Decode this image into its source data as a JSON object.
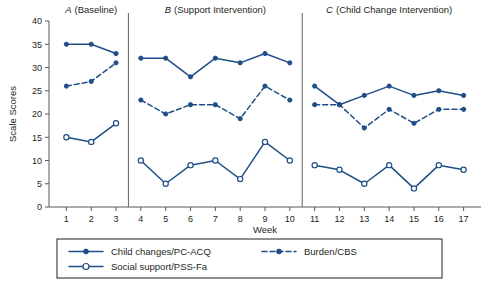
{
  "chart_data": {
    "type": "line",
    "title": "",
    "xlabel": "Week",
    "ylabel": "Scale Scores",
    "xlim": [
      0.3,
      17.7
    ],
    "ylim": [
      0,
      40
    ],
    "yticks": [
      0,
      5,
      10,
      15,
      20,
      25,
      30,
      35,
      40
    ],
    "xticks": [
      1,
      2,
      3,
      4,
      5,
      6,
      7,
      8,
      9,
      10,
      11,
      12,
      13,
      14,
      15,
      16,
      17
    ],
    "grid": false,
    "legend_position": "bottom",
    "accent_color": "#1f4e87",
    "axis_color": "#58595b",
    "panels": [
      {
        "id": "A",
        "letter": "A",
        "label": "(Baseline)",
        "title": "A (Baseline)",
        "weeks": [
          1,
          2,
          3
        ]
      },
      {
        "id": "B",
        "letter": "B",
        "label": "(Support Intervention)",
        "title": "B (Support Intervention)",
        "weeks": [
          4,
          5,
          6,
          7,
          8,
          9,
          10
        ]
      },
      {
        "id": "C",
        "letter": "C",
        "label": "(Child Change Intervention)",
        "title": "C (Child Change Intervention)",
        "weeks": [
          11,
          12,
          13,
          14,
          15,
          16,
          17
        ]
      }
    ],
    "dividers": [
      3.5,
      10.5
    ],
    "series": [
      {
        "name": "Child changes/PC-ACQ",
        "style": "solid",
        "marker": "filled-circle",
        "color": "#1f4e87",
        "segments": [
          {
            "panel": "A",
            "x": [
              1,
              2,
              3
            ],
            "values": [
              35,
              35,
              33
            ]
          },
          {
            "panel": "B",
            "x": [
              4,
              5,
              6,
              7,
              8,
              9,
              10
            ],
            "values": [
              32,
              32,
              28,
              32,
              31,
              33,
              31
            ]
          },
          {
            "panel": "C",
            "x": [
              11,
              12,
              13,
              14,
              15,
              16,
              17
            ],
            "values": [
              26,
              22,
              24,
              26,
              24,
              25,
              24
            ]
          }
        ]
      },
      {
        "name": "Burden/CBS",
        "style": "dashed",
        "marker": "filled-circle",
        "color": "#1f4e87",
        "segments": [
          {
            "panel": "A",
            "x": [
              1,
              2,
              3
            ],
            "values": [
              26,
              27,
              31
            ]
          },
          {
            "panel": "B",
            "x": [
              4,
              5,
              6,
              7,
              8,
              9,
              10
            ],
            "values": [
              23,
              20,
              22,
              22,
              19,
              26,
              23
            ]
          },
          {
            "panel": "C",
            "x": [
              11,
              12,
              13,
              14,
              15,
              16,
              17
            ],
            "values": [
              22,
              22,
              17,
              21,
              18,
              21,
              21
            ]
          }
        ]
      },
      {
        "name": "Social support/PSS-Fa",
        "style": "solid",
        "marker": "open-circle",
        "color": "#1f4e87",
        "segments": [
          {
            "panel": "A",
            "x": [
              1,
              2,
              3
            ],
            "values": [
              15,
              14,
              18
            ]
          },
          {
            "panel": "B",
            "x": [
              4,
              5,
              6,
              7,
              8,
              9,
              10
            ],
            "values": [
              10,
              5,
              9,
              10,
              6,
              14,
              10
            ]
          },
          {
            "panel": "C",
            "x": [
              11,
              12,
              13,
              14,
              15,
              16,
              17
            ],
            "values": [
              9,
              8,
              5,
              9,
              4,
              9,
              8
            ]
          }
        ]
      }
    ],
    "legend": [
      {
        "label": "Child changes/PC-ACQ",
        "style": "solid",
        "marker": "filled-circle"
      },
      {
        "label": "Burden/CBS",
        "style": "dashed",
        "marker": "filled-circle"
      },
      {
        "label": "Social support/PSS-Fa",
        "style": "solid",
        "marker": "open-circle"
      }
    ]
  }
}
